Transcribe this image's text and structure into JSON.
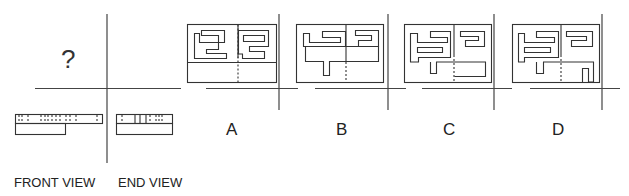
{
  "question": {
    "unknown_view_marker": "?",
    "view_labels": {
      "front": "FRONT VIEW",
      "end": "END VIEW"
    }
  },
  "options": [
    {
      "label": "A"
    },
    {
      "label": "B"
    },
    {
      "label": "C"
    },
    {
      "label": "D"
    }
  ],
  "colors": {
    "line": "#333333",
    "background": "#ffffff"
  }
}
